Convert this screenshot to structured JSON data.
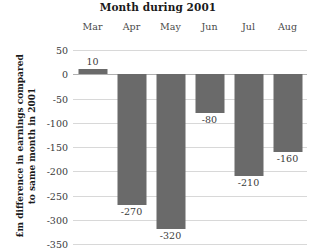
{
  "chart_data": {
    "type": "bar",
    "title": "Month during 2001",
    "xlabel": "",
    "ylabel": "£m difference in earnings compared to same month in 2001",
    "ylabel_lines": [
      "£m difference in earnings compared",
      "to same month in 2001"
    ],
    "categories": [
      "Mar",
      "Apr",
      "May",
      "Jun",
      "Jul",
      "Aug"
    ],
    "values": [
      10,
      -270,
      -320,
      -80,
      -210,
      -160
    ],
    "value_labels": [
      "10",
      "-270",
      "-320",
      "-80",
      "-210",
      "-160"
    ],
    "ylim": [
      -350,
      50
    ],
    "yticks": [
      50,
      0,
      -50,
      -100,
      -150,
      -200,
      -250,
      -300,
      -350
    ],
    "ytick_labels": [
      "50",
      "0",
      "-50",
      "-100",
      "-150",
      "-200",
      "-250",
      "-300",
      "-350"
    ],
    "grid": true,
    "legend": false,
    "bar_color": "#6a6a6a",
    "gridline_color": "#d8d8d8",
    "axis_color": "#b0b0b0",
    "background": "#ffffff",
    "category_axis_position": "top"
  }
}
